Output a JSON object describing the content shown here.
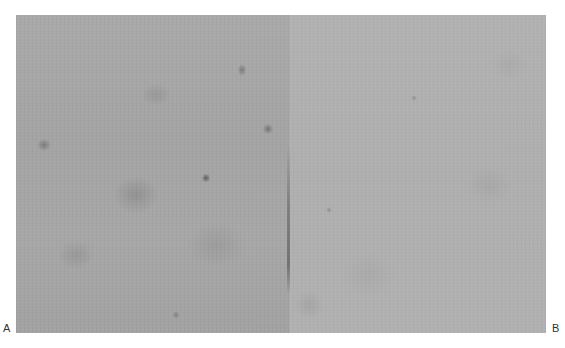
{
  "figure": {
    "panels": [
      {
        "label": "A",
        "description": "grayscale micrograph with darker mottled regions and scattered dark spots"
      },
      {
        "label": "B",
        "description": "lighter, more uniform grayscale micrograph"
      }
    ]
  }
}
